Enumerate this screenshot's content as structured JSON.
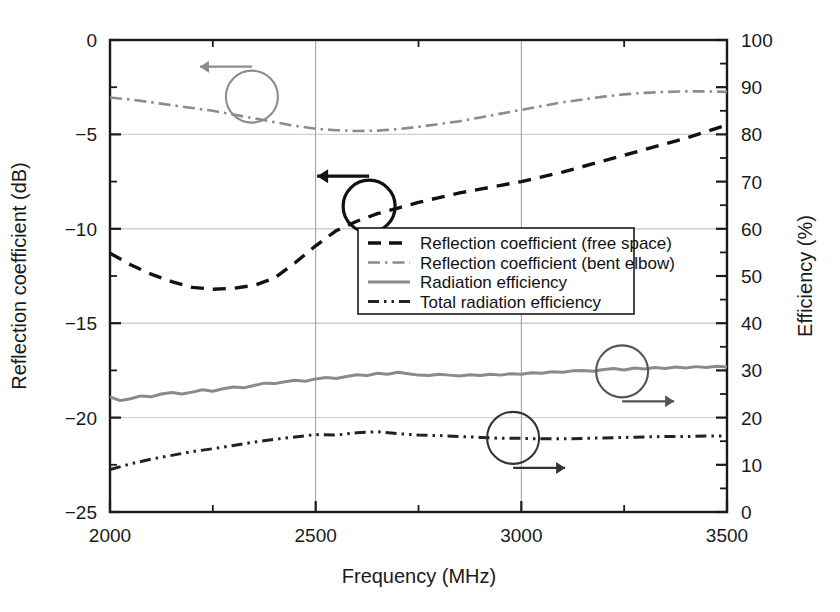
{
  "chart_data": {
    "type": "line",
    "title": "",
    "xlabel": "Frequency (MHz)",
    "ylabel": "Reflection coefficient (dB)",
    "y2label": "Efficiency (%)",
    "xlim": [
      2000,
      3500
    ],
    "ylim": [
      -25,
      0
    ],
    "y2lim": [
      0,
      100
    ],
    "xticks": [
      2000,
      2500,
      3000,
      3500
    ],
    "xtick_labels": [
      "2000",
      "2500",
      "3000",
      "3500"
    ],
    "xminor_step": 250,
    "yticks": [
      -25,
      -20,
      -15,
      -10,
      -5,
      0
    ],
    "ytick_labels": [
      "−25",
      "−20",
      "−15",
      "−10",
      "−5",
      "0"
    ],
    "yminor_step": 2.5,
    "y2ticks": [
      0,
      10,
      20,
      30,
      40,
      50,
      60,
      70,
      80,
      90,
      100
    ],
    "y2tick_labels": [
      "0",
      "10",
      "20",
      "30",
      "40",
      "50",
      "60",
      "70",
      "80",
      "90",
      "100"
    ],
    "y2minor_step": 5,
    "grid": true,
    "legend_position": "center-right",
    "series": [
      {
        "name": "Reflection coefficient (free space)",
        "axis": "left",
        "style": "dashed",
        "color": "#111111",
        "x": [
          2000,
          2050,
          2100,
          2150,
          2200,
          2250,
          2300,
          2350,
          2400,
          2450,
          2500,
          2550,
          2600,
          2650,
          2700,
          2750,
          2800,
          2850,
          2900,
          2950,
          3000,
          3050,
          3100,
          3150,
          3200,
          3250,
          3300,
          3350,
          3400,
          3450,
          3500
        ],
        "y": [
          -11.3,
          -11.9,
          -12.4,
          -12.8,
          -13.1,
          -13.2,
          -13.15,
          -13.0,
          -12.6,
          -11.8,
          -10.9,
          -10.1,
          -9.6,
          -9.2,
          -8.9,
          -8.6,
          -8.35,
          -8.1,
          -7.9,
          -7.7,
          -7.5,
          -7.25,
          -7.0,
          -6.7,
          -6.4,
          -6.1,
          -5.8,
          -5.5,
          -5.2,
          -4.85,
          -4.5
        ]
      },
      {
        "name": "Reflection coefficient (bent elbow)",
        "axis": "left",
        "style": "dash-dot",
        "color": "#8c8c8c",
        "x": [
          2000,
          2050,
          2100,
          2150,
          2200,
          2250,
          2300,
          2350,
          2400,
          2450,
          2500,
          2550,
          2600,
          2650,
          2700,
          2750,
          2800,
          2850,
          2900,
          2950,
          3000,
          3050,
          3100,
          3150,
          3200,
          3250,
          3300,
          3350,
          3400,
          3450,
          3500
        ],
        "y": [
          -3.05,
          -3.15,
          -3.3,
          -3.45,
          -3.6,
          -3.75,
          -3.95,
          -4.15,
          -4.35,
          -4.55,
          -4.7,
          -4.78,
          -4.82,
          -4.8,
          -4.72,
          -4.6,
          -4.45,
          -4.3,
          -4.1,
          -3.9,
          -3.7,
          -3.5,
          -3.3,
          -3.15,
          -3.0,
          -2.88,
          -2.8,
          -2.75,
          -2.72,
          -2.72,
          -2.75
        ]
      },
      {
        "name": "Radiation efficiency",
        "axis": "right",
        "style": "solid",
        "color": "#8a8a8a",
        "x": [
          2000,
          2025,
          2050,
          2075,
          2100,
          2125,
          2150,
          2175,
          2200,
          2225,
          2250,
          2275,
          2300,
          2325,
          2350,
          2375,
          2400,
          2425,
          2450,
          2475,
          2500,
          2525,
          2550,
          2575,
          2600,
          2625,
          2650,
          2675,
          2700,
          2725,
          2750,
          2775,
          2800,
          2825,
          2850,
          2875,
          2900,
          2925,
          2950,
          2975,
          3000,
          3025,
          3050,
          3075,
          3100,
          3125,
          3150,
          3175,
          3200,
          3225,
          3250,
          3275,
          3300,
          3325,
          3350,
          3375,
          3400,
          3425,
          3450,
          3475,
          3500
        ],
        "y": [
          24.4,
          23.6,
          24.0,
          24.6,
          24.4,
          25.0,
          25.3,
          25.0,
          25.4,
          25.9,
          25.6,
          26.1,
          26.5,
          26.3,
          26.8,
          27.3,
          27.2,
          27.6,
          27.9,
          27.7,
          28.2,
          28.5,
          28.3,
          28.7,
          29.1,
          28.9,
          29.4,
          29.2,
          29.6,
          29.3,
          29.0,
          28.9,
          29.2,
          29.0,
          28.8,
          29.1,
          28.9,
          29.2,
          29.0,
          29.3,
          29.2,
          29.5,
          29.4,
          29.7,
          29.6,
          29.9,
          30.0,
          29.8,
          30.2,
          30.4,
          30.1,
          30.5,
          30.3,
          30.6,
          30.4,
          30.7,
          30.5,
          30.8,
          30.6,
          30.9,
          30.7
        ]
      },
      {
        "name": "Total radiation efficiency",
        "axis": "right",
        "style": "dash-dot-dot",
        "color": "#222222",
        "x": [
          2000,
          2050,
          2100,
          2150,
          2200,
          2250,
          2300,
          2350,
          2400,
          2450,
          2500,
          2550,
          2600,
          2650,
          2700,
          2750,
          2800,
          2850,
          2900,
          2950,
          3000,
          3050,
          3100,
          3150,
          3200,
          3250,
          3300,
          3350,
          3400,
          3450,
          3500
        ],
        "y": [
          9.0,
          10.2,
          11.2,
          12.0,
          12.8,
          13.4,
          14.1,
          14.8,
          15.4,
          15.9,
          16.4,
          16.3,
          16.8,
          17.0,
          16.6,
          16.3,
          16.2,
          16.0,
          15.8,
          15.6,
          15.6,
          15.5,
          15.5,
          15.6,
          15.7,
          15.8,
          15.9,
          16.0,
          16.0,
          16.1,
          16.1
        ]
      }
    ],
    "annotations": [
      {
        "name": "arrow-left-efficiency-bent",
        "type": "circle-arrow",
        "direction": "left",
        "color": "#8c8c8c",
        "cx": 2345,
        "cy_left": -3.0
      },
      {
        "name": "arrow-left-reflection-free",
        "type": "circle-arrow",
        "direction": "left",
        "color": "#111111",
        "cx": 2630,
        "cy_left": -8.8
      },
      {
        "name": "arrow-right-radiation-efficiency",
        "type": "circle-arrow",
        "direction": "right",
        "color": "#555555",
        "cx": 3245,
        "cy_right": 29.8
      },
      {
        "name": "arrow-right-total-efficiency",
        "type": "circle-arrow",
        "direction": "right",
        "color": "#333333",
        "cx": 2980,
        "cy_right": 15.7
      }
    ]
  },
  "legend": {
    "items": [
      {
        "label": "Reflection coefficient (free space)",
        "style": "dashed",
        "color": "#111111"
      },
      {
        "label": "Reflection coefficient (bent elbow)",
        "style": "dash-dot",
        "color": "#8c8c8c"
      },
      {
        "label": "Radiation efficiency",
        "style": "solid",
        "color": "#8a8a8a"
      },
      {
        "label": "Total radiation efficiency",
        "style": "dash-dot-dot",
        "color": "#222222"
      }
    ]
  }
}
